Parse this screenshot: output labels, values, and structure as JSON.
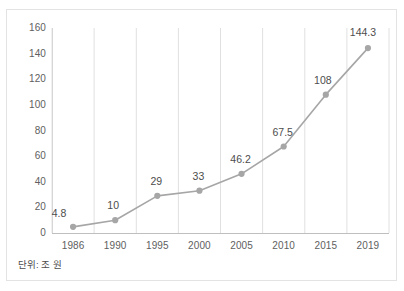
{
  "chart_data": {
    "type": "line",
    "title": "",
    "subtitle": "",
    "xlabel": "",
    "ylabel": "",
    "categories": [
      "1986",
      "1990",
      "1995",
      "2000",
      "2005",
      "2010",
      "2015",
      "2019"
    ],
    "values": [
      4.8,
      10,
      29,
      33,
      46.2,
      67.5,
      108,
      144.3
    ],
    "point_labels": [
      "4.8",
      "10",
      "29",
      "33",
      "46.2",
      "67.5",
      "108",
      "144.3"
    ],
    "ylim": [
      0,
      160
    ],
    "ytick_step": 20,
    "yticks": [
      "160",
      "140",
      "120",
      "100",
      "80",
      "60",
      "40",
      "20",
      "0"
    ],
    "grid": {
      "vertical": true,
      "horizontal": false,
      "color": "#e0e0e0"
    },
    "legend": {
      "visible": false,
      "position": "none",
      "entries": []
    },
    "series_color": "#a6a6a6",
    "marker": "circle",
    "marker_color": "#a6a6a6",
    "axis_color": "#d0d0d0",
    "text_color": "#595959"
  },
  "caption": {
    "unit_note": "단위: 조 원"
  },
  "frame": {
    "border_color": "#e3e3e3",
    "background": "#ffffff"
  }
}
